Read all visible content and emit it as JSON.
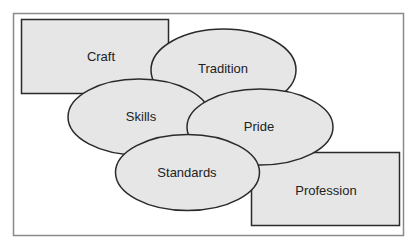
{
  "diagram": {
    "title": "",
    "colors": {
      "background": "#ffffff",
      "frame_stroke": "#8a8a8a",
      "shape_fill": "#e6e6e6",
      "shape_stroke": "#2a2a2a",
      "text": "#222222"
    },
    "nodes": [
      {
        "id": "craft",
        "shape": "rectangle",
        "label": "Craft"
      },
      {
        "id": "tradition",
        "shape": "ellipse",
        "label": "Tradition"
      },
      {
        "id": "skills",
        "shape": "ellipse",
        "label": "Skills"
      },
      {
        "id": "pride",
        "shape": "ellipse",
        "label": "Pride"
      },
      {
        "id": "standards",
        "shape": "ellipse",
        "label": "Standards"
      },
      {
        "id": "profession",
        "shape": "rectangle",
        "label": "Profession"
      }
    ]
  }
}
